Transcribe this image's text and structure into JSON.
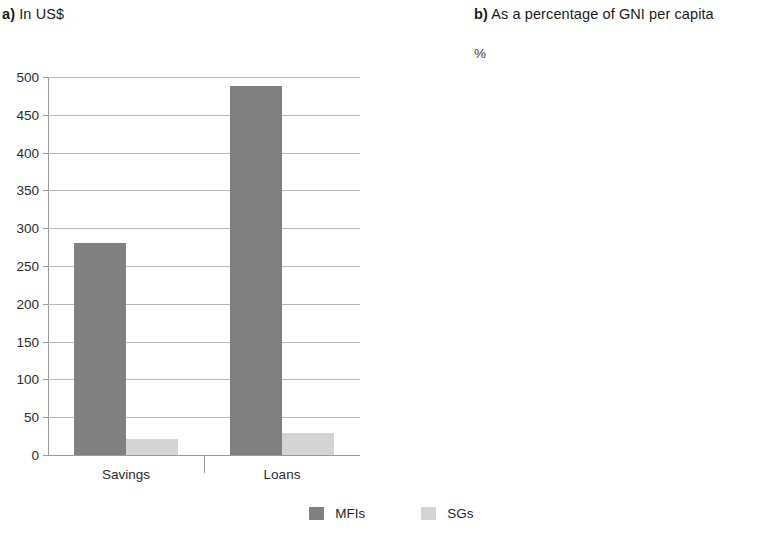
{
  "figure": {
    "panels": [
      {
        "id": "a",
        "prefix": "a)",
        "title": "In US$",
        "unit_label": ""
      },
      {
        "id": "b",
        "prefix": "b)",
        "title": "As a percentage of GNI per capita",
        "unit_label": "%"
      }
    ],
    "legend": {
      "items": [
        {
          "label": "MFIs",
          "color": "#808080"
        },
        {
          "label": "SGs",
          "color": "#d4d4d4"
        }
      ]
    }
  },
  "chart_data": [
    {
      "type": "bar",
      "panel": "a)",
      "title": "In US$",
      "xlabel": "",
      "ylabel": "",
      "ylim": [
        0,
        500
      ],
      "ytick_labels": [
        "500",
        "450",
        "400",
        "350",
        "300",
        "250",
        "200",
        "150",
        "100",
        "50",
        "0"
      ],
      "yticks": [
        500,
        450,
        400,
        350,
        300,
        250,
        200,
        150,
        100,
        50,
        0
      ],
      "grid": true,
      "legend_position": "bottom-center",
      "categories": [
        "Savings",
        "Loans"
      ],
      "series": [
        {
          "name": "MFIs",
          "color": "#808080",
          "values": [
            280,
            488
          ]
        },
        {
          "name": "SGs",
          "color": "#d4d4d4",
          "values": [
            21,
            29
          ]
        }
      ]
    },
    {
      "type": "bar",
      "panel": "b)",
      "title": "As a percentage of GNI per capita",
      "xlabel": "",
      "ylabel": "%",
      "ylim": [
        0,
        100
      ],
      "ytick_labels": [
        "100",
        "90",
        "80",
        "70",
        "60",
        "50",
        "40",
        "30",
        "20",
        "10",
        "0"
      ],
      "yticks": [
        100,
        90,
        80,
        70,
        60,
        50,
        40,
        30,
        20,
        10,
        0
      ],
      "grid": true,
      "legend_position": "bottom-center",
      "categories": [
        "Savings",
        "Loans"
      ],
      "series": [
        {
          "name": "MFIs",
          "color": "#808080",
          "values": [
            18.5,
            35.0
          ]
        },
        {
          "name": "SGs",
          "color": "#d4d4d4",
          "values": [
            6.6,
            4.4
          ]
        }
      ]
    }
  ]
}
